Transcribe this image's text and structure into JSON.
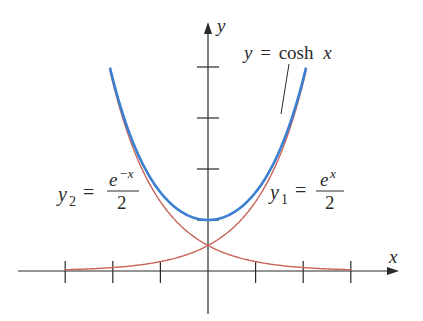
{
  "chart_data": {
    "type": "line",
    "title": "",
    "xlabel": "x",
    "ylabel": "y",
    "xlim": [
      -3,
      3
    ],
    "ylim": [
      0,
      4
    ],
    "x_ticks": [
      -3,
      -2,
      -1,
      0,
      1,
      2,
      3
    ],
    "y_ticks": [
      1,
      2,
      3,
      4
    ],
    "tick_labels_shown": false,
    "grid": false,
    "series": [
      {
        "name": "y = cosh x",
        "color": "#3a7fd0",
        "x": [
          -2.06,
          -1.5,
          -1,
          -0.5,
          0,
          0.5,
          1,
          1.5,
          2.06
        ],
        "values": [
          3.99,
          2.35,
          1.54,
          1.13,
          1.0,
          1.13,
          1.54,
          2.35,
          3.99
        ]
      },
      {
        "name": "y1 = e^x / 2",
        "color": "#c8655a",
        "x": [
          -3,
          -2,
          -1,
          0,
          1,
          2,
          2.77
        ],
        "values": [
          0.025,
          0.068,
          0.184,
          0.5,
          1.36,
          3.69,
          8.0
        ]
      },
      {
        "name": "y2 = e^-x / 2",
        "color": "#c8655a",
        "x": [
          -2.77,
          -2,
          -1,
          0,
          1,
          2,
          3
        ],
        "values": [
          8.0,
          3.69,
          1.36,
          0.5,
          0.184,
          0.068,
          0.025
        ]
      }
    ]
  },
  "labels": {
    "x_axis": "x",
    "y_axis": "y",
    "cosh": {
      "lhs": "y",
      "eq": "=",
      "rhs": "cosh",
      "var": "x"
    },
    "y1": {
      "var": "y",
      "sub": "1",
      "eq": "=",
      "num_base": "e",
      "num_exp": "x",
      "den": "2"
    },
    "y2": {
      "var": "y",
      "sub": "2",
      "eq": "=",
      "num_base": "e",
      "num_exp": "−x",
      "den": "2"
    }
  },
  "colors": {
    "axis": "#2a2a2a",
    "cosh": "#3a7fd0",
    "exp": "#c8655a"
  }
}
